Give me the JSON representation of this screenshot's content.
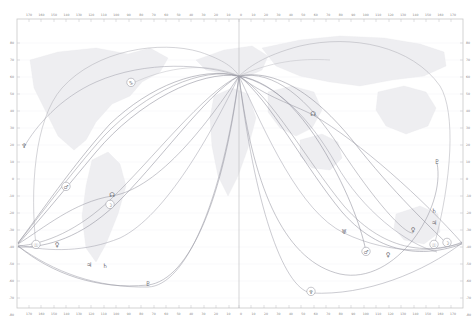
{
  "chart_data": {
    "type": "line",
    "title": "",
    "xlabel": "",
    "ylabel": "",
    "xlim": [
      -180,
      180
    ],
    "ylim": [
      -90,
      90
    ],
    "grid": true,
    "legend_position": "none",
    "projection": "equirectangular world map",
    "background": "faint world map outline",
    "x_ticks_left": [
      "170",
      "160",
      "150",
      "140",
      "130",
      "120",
      "110",
      "100",
      "90",
      "80",
      "70",
      "60",
      "50",
      "40",
      "30",
      "20",
      "10"
    ],
    "x_ticks_right": [
      "0",
      "10",
      "20",
      "30",
      "40",
      "50",
      "60",
      "70",
      "80",
      "90",
      "100",
      "110",
      "120",
      "130",
      "140",
      "150",
      "160",
      "170"
    ],
    "y_ticks": [
      "80",
      "70",
      "60",
      "50",
      "40",
      "30",
      "20",
      "10",
      "0",
      "-10",
      "-20",
      "-30",
      "-40",
      "-50",
      "-60",
      "-70",
      "-80"
    ],
    "convergence_points": [
      {
        "name": "center-node",
        "x": 0,
        "y": 42
      },
      {
        "name": "left-node",
        "x": -178,
        "y": -18
      },
      {
        "name": "right-node",
        "x": 176,
        "y": -18
      }
    ],
    "series": [
      {
        "name": "Sun MC",
        "glyph": "☉",
        "color": "#9a9aa4"
      },
      {
        "name": "Moon MC",
        "glyph": "☽",
        "color": "#8e8e98"
      },
      {
        "name": "Mercury MC",
        "glyph": "☿",
        "color": "#a0a0aa"
      },
      {
        "name": "Venus AC",
        "glyph": "♀",
        "color": "#9494a0"
      },
      {
        "name": "Mars AC",
        "glyph": "♂",
        "color": "#8a8a96"
      },
      {
        "name": "Jupiter DC",
        "glyph": "♃",
        "color": "#9696a2"
      },
      {
        "name": "Saturn DC",
        "glyph": "♄",
        "color": "#8c8c98"
      },
      {
        "name": "Uranus IC",
        "glyph": "♅",
        "color": "#a2a2ac"
      },
      {
        "name": "Neptune IC",
        "glyph": "♆",
        "color": "#9e9ea8"
      },
      {
        "name": "Pluto IC",
        "glyph": "♇",
        "color": "#92929e"
      },
      {
        "name": "North Node",
        "glyph": "☊",
        "color": "#9898a4"
      }
    ],
    "markers": [
      {
        "glyph": "♆",
        "label": "Neptune",
        "x": 24,
        "y": 147,
        "circled": false
      },
      {
        "glyph": "♑",
        "label": "Capricorn",
        "x": 131,
        "y": 84,
        "circled": true
      },
      {
        "glyph": "♂",
        "label": "Mars",
        "x": 66,
        "y": 188,
        "circled": true
      },
      {
        "glyph": "☊",
        "label": "NorthNode",
        "x": 112,
        "y": 196,
        "circled": false
      },
      {
        "glyph": "☽",
        "label": "Moon",
        "x": 110,
        "y": 206,
        "circled": true
      },
      {
        "glyph": "♀",
        "label": "Venus",
        "x": 57,
        "y": 246,
        "circled": false
      },
      {
        "glyph": "☉",
        "label": "Sun",
        "x": 36,
        "y": 246,
        "circled": true
      },
      {
        "glyph": "♃",
        "label": "Jupiter",
        "x": 89,
        "y": 266,
        "circled": false
      },
      {
        "glyph": "♄",
        "label": "Saturn",
        "x": 105,
        "y": 267,
        "circled": false
      },
      {
        "glyph": "♇",
        "label": "Pluto",
        "x": 148,
        "y": 285,
        "circled": false
      },
      {
        "glyph": "☊",
        "label": "NorthNode",
        "x": 313,
        "y": 115,
        "circled": false
      },
      {
        "glyph": "♇",
        "label": "Pluto",
        "x": 437,
        "y": 163,
        "circled": false
      },
      {
        "glyph": "♄",
        "label": "Saturn",
        "x": 434,
        "y": 212,
        "circled": false
      },
      {
        "glyph": "♃",
        "label": "Jupiter",
        "x": 434,
        "y": 224,
        "circled": false
      },
      {
        "glyph": "♀",
        "label": "Venus",
        "x": 413,
        "y": 231,
        "circled": false
      },
      {
        "glyph": "☉",
        "label": "Sun",
        "x": 434,
        "y": 246,
        "circled": true
      },
      {
        "glyph": "☽",
        "label": "Moon",
        "x": 447,
        "y": 244,
        "circled": true
      },
      {
        "glyph": "♂",
        "label": "Mars",
        "x": 366,
        "y": 253,
        "circled": true
      },
      {
        "glyph": "♀",
        "label": "Venus",
        "x": 388,
        "y": 256,
        "circled": false
      },
      {
        "glyph": "♅",
        "label": "Uranus",
        "x": 344,
        "y": 233,
        "circled": false
      },
      {
        "glyph": "♆",
        "label": "Neptune",
        "x": 311,
        "y": 293,
        "circled": true
      }
    ]
  },
  "plot": {
    "frame_color": "#c8c8c8",
    "curve_color": "#9a9aa4",
    "map_color": "#ededf0",
    "meridian_label": "0"
  }
}
